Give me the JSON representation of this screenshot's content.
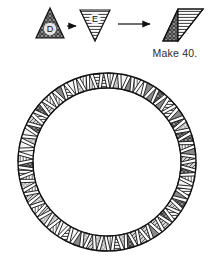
{
  "figure": {
    "caption": "Make 40.",
    "units": [
      {
        "id": "unit-d",
        "label": "D",
        "orientation": "point-up",
        "fill": "crosshatch-dark",
        "position": "left"
      },
      {
        "id": "unit-e",
        "label": "E",
        "orientation": "point-down",
        "fill": "horizontal-lines",
        "position": "middle"
      },
      {
        "id": "unit-de",
        "label": "",
        "orientation": "parallelogram",
        "fill": "crosshatch-dark + horizontal-lines",
        "position": "right"
      }
    ],
    "arrows": [
      {
        "id": "arrow-1",
        "from": "unit-d",
        "to": "unit-e",
        "direction": "right"
      },
      {
        "id": "arrow-2",
        "from": "unit-e",
        "to": "unit-de",
        "direction": "right"
      }
    ]
  },
  "ring": {
    "name": "pieced circular border",
    "triangle_count": 80,
    "pair_count": 40,
    "outer_radius": 89,
    "inner_radius": 74,
    "center_x": 107,
    "center_y": 162,
    "fills": [
      "crosshatch-dark",
      "horizontal-lines",
      "dots",
      "blank",
      "vertical-lines",
      "diagonal-lines"
    ]
  },
  "colors": {
    "ink": "#1a1a1a",
    "paper": "#ffffff",
    "dark_fill": "#6d6d6d",
    "mid_fill": "#a8a8a8",
    "light_fill": "#e8e8e8",
    "caption_ink": "#2b2b2b"
  }
}
